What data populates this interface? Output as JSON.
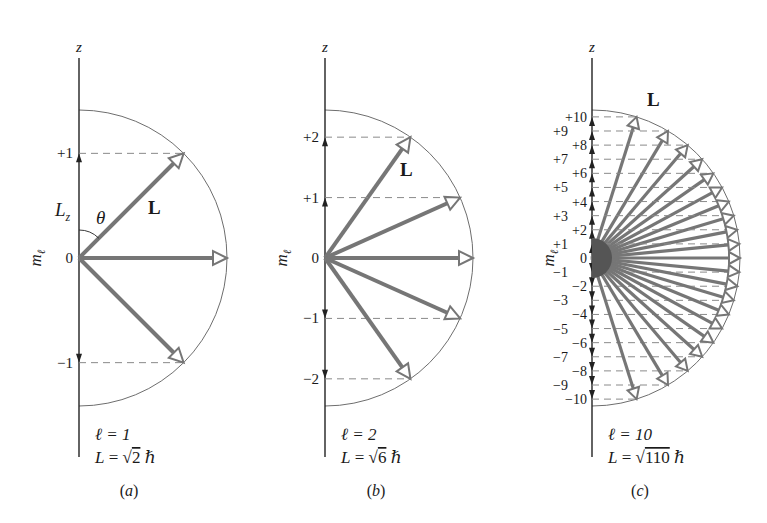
{
  "figure": {
    "colors": {
      "axis": "#222222",
      "vector": "#767676",
      "dashed": "#8a8a8a",
      "circle": "#6e6e6e",
      "text": "#1a1a1a"
    },
    "axis_label": "z",
    "ml_label": "m",
    "ml_subscript": "ℓ",
    "panels": [
      {
        "id": "a",
        "caption": "(a)",
        "l": 1,
        "l_label": "ℓ = 1",
        "L_label_prefix": "L = ",
        "L_sqrt": "2",
        "hbar": "ℏ",
        "axis_x": 79,
        "radius": 148,
        "vector_label": "L",
        "vector_label_pos": [
          148,
          214
        ],
        "extra_labels": [
          {
            "text": "θ",
            "x": 96,
            "y": 224
          },
          {
            "text": "L",
            "sub": "z",
            "x": 55,
            "y": 216
          }
        ],
        "show_theta_arc": true,
        "ml_values": [
          "+1",
          "0",
          "−1"
        ]
      },
      {
        "id": "b",
        "caption": "(b)",
        "l": 2,
        "l_label": "ℓ = 2",
        "L_label_prefix": "L = ",
        "L_sqrt": "6",
        "hbar": "ℏ",
        "axis_x": 325,
        "radius": 148,
        "vector_label": "L",
        "vector_label_pos": [
          400,
          176
        ],
        "extra_labels": [],
        "show_theta_arc": false,
        "ml_values": [
          "+2",
          "+1",
          "0",
          "−1",
          "−2"
        ]
      },
      {
        "id": "c",
        "caption": "(c)",
        "l": 10,
        "l_label": "ℓ = 10",
        "L_label_prefix": "L = ",
        "L_sqrt": "110",
        "hbar": "ℏ",
        "axis_x": 592,
        "radius": 148,
        "vector_label": "L",
        "vector_label_pos": [
          647,
          106
        ],
        "extra_labels": [],
        "show_theta_arc": false,
        "ml_values": [
          "+10",
          "+9",
          "+8",
          "+7",
          "+6",
          "+5",
          "+4",
          "+3",
          "+2",
          "+1",
          "0",
          "−1",
          "−2",
          "−3",
          "−4",
          "−5",
          "−6",
          "−7",
          "−8",
          "−9",
          "−10"
        ]
      }
    ]
  }
}
